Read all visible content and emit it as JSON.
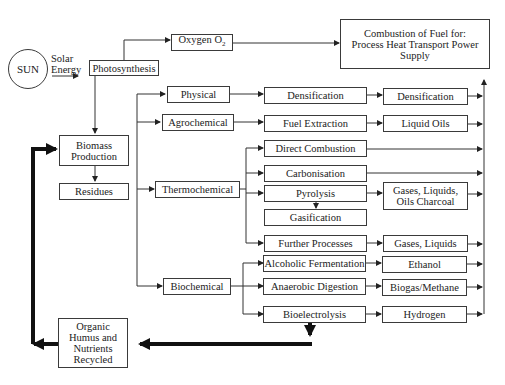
{
  "diagram": {
    "sun": {
      "label": "SUN",
      "energy_label_line1": "Solar",
      "energy_label_line2": "Energy"
    },
    "photosynthesis": "Photosynthesis",
    "oxygen": {
      "label": "Oxygen O",
      "subscript": "2"
    },
    "combustion": {
      "line1": "Combustion of Fuel for:",
      "line2": "Process Heat Transport Power",
      "line3": "Supply"
    },
    "biomass_production": {
      "line1": "Biomass",
      "line2": "Production"
    },
    "residues": "Residues",
    "organic": {
      "line1": "Organic",
      "line2": "Humus and",
      "line3": "Nutrients",
      "line4": "Recycled"
    },
    "categories": {
      "physical": "Physical",
      "agrochemical": "Agrochemical",
      "thermochemical": "Thermochemical",
      "biochemical": "Biochemical"
    },
    "processes": {
      "densification": "Densification",
      "fuel_extraction": "Fuel Extraction",
      "direct_combustion": "Direct Combustion",
      "carbonisation": "Carbonisation",
      "pyrolysis": "Pyrolysis",
      "gasification": "Gasification",
      "further_processes": "Further Processes",
      "alcoholic_fermentation": "Alcoholic Fermentation",
      "anaerobic_digestion": "Anaerobic Digestion",
      "bioelectrolysis": "Bioelectrolysis"
    },
    "products": {
      "densification": "Densification",
      "liquid_oils": "Liquid Oils",
      "pyrolysis_products_line1": "Gases, Liquids,",
      "pyrolysis_products_line2": "Oils Charcoal",
      "gases_liquids": "Gases, Liquids",
      "ethanol": "Ethanol",
      "biogas_methane": "Biogas/Methane",
      "hydrogen": "Hydrogen"
    }
  }
}
